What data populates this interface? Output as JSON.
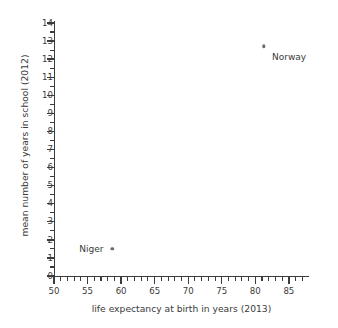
{
  "chart_data": {
    "type": "scatter",
    "title": "",
    "xlabel": "life expectancy at birth in years (2013)",
    "ylabel": "mean number of years in school (2012)",
    "xlim": [
      50,
      88
    ],
    "ylim": [
      0,
      14
    ],
    "grid": false,
    "legend": "none",
    "x_ticks": [
      50,
      55,
      60,
      65,
      70,
      75,
      80,
      85
    ],
    "x_tick_labels": [
      "50",
      "55",
      "60",
      "65",
      "70",
      "75",
      "80",
      "85"
    ],
    "x_minor_tick_step": 1,
    "y_ticks": [
      0,
      1,
      2,
      3,
      4,
      5,
      6,
      7,
      8,
      9,
      10,
      11,
      12,
      13,
      14
    ],
    "y_tick_labels": [
      "0",
      "1",
      "2",
      "3",
      "4",
      "5",
      "6",
      "7",
      "8",
      "9",
      "10",
      "11",
      "12",
      "13",
      "14"
    ],
    "y_minor_tick_step": 0.5,
    "marker_color": "#6e6e6e",
    "axis_color": "#3c3c3c",
    "text_color": "#3a3a3a",
    "points": [
      {
        "name": "Norway",
        "x": 81.3,
        "y": 12.7,
        "label": "Norway",
        "label_side": "right"
      },
      {
        "name": "Niger",
        "x": 58.7,
        "y": 1.5,
        "label": "Niger",
        "label_side": "left"
      }
    ]
  }
}
